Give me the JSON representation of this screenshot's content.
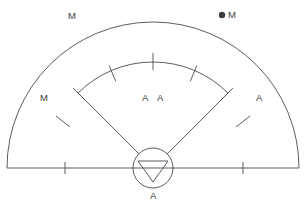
{
  "diagram": {
    "type": "radar-sector-scope",
    "background_color": "#ffffff",
    "stroke_color": "#4a4a52",
    "label_color": "#3a3a40",
    "geometry": {
      "center_x": 153,
      "center_y": 168,
      "outer_radius": 146,
      "inner_radius": 106,
      "hub_radius": 20,
      "sector_half_angle_deg": 45,
      "baseline_y": 168,
      "baseline_x_start": 12,
      "baseline_x_end": 295
    },
    "labels": [
      {
        "id": "label-m-top-left",
        "text": "M",
        "x": 68,
        "y": 11
      },
      {
        "id": "label-m-top-right",
        "text": "M",
        "x": 228,
        "y": 10
      },
      {
        "id": "label-m-left",
        "text": "M",
        "x": 40,
        "y": 93
      },
      {
        "id": "label-a-center-left",
        "text": "A",
        "x": 142,
        "y": 93
      },
      {
        "id": "label-a-center-right",
        "text": "A",
        "x": 157,
        "y": 93
      },
      {
        "id": "label-a-right",
        "text": "A",
        "x": 256,
        "y": 93
      },
      {
        "id": "label-a-bottom",
        "text": "A",
        "x": 150,
        "y": 191
      }
    ],
    "point_marker": {
      "id": "point-marker-m",
      "x": 222,
      "y": 15,
      "radius": 3.2,
      "color": "#3d3d44"
    },
    "inner_arc_ticks_deg": [
      -45,
      -22.5,
      0,
      22.5,
      45
    ],
    "outer_region_ticks_deg": [
      -50,
      50
    ],
    "baseline_ticks_x": [
      65,
      243
    ],
    "hub": {
      "shape": "circle-with-down-triangle",
      "triangle_orientation": "down"
    }
  }
}
